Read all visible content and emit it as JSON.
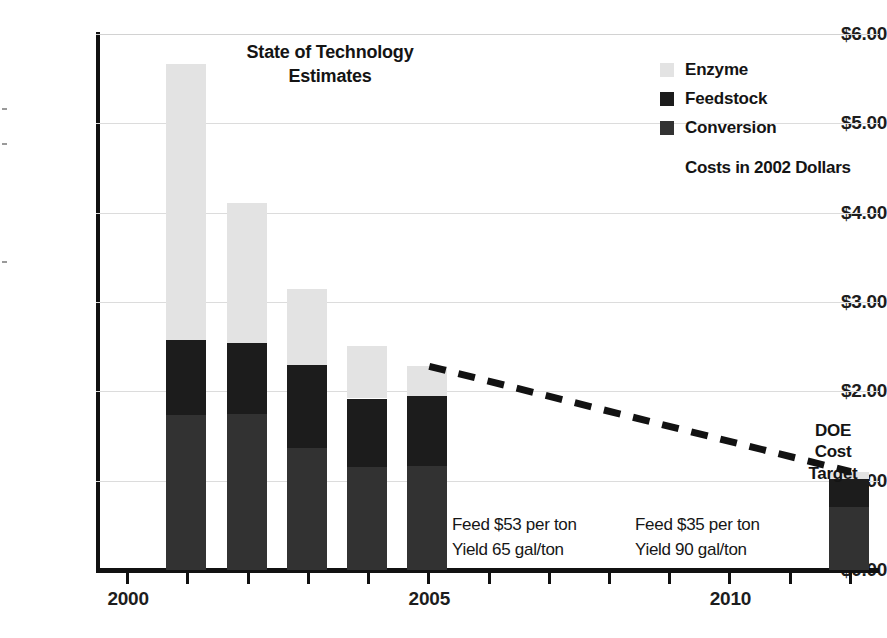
{
  "chart_data": {
    "type": "bar",
    "subtype": "stacked-bar-with-trendline",
    "title": "State of Technology Estimates",
    "xlabel": "",
    "ylabel": "",
    "ylim": [
      0,
      6
    ],
    "ytick_values": [
      0,
      1,
      2,
      3,
      4,
      5,
      6
    ],
    "ytick_labels": [
      "$0.00",
      "$1.00",
      "$2.00",
      "$3.00",
      "$4.00",
      "$5.00",
      "$6.00"
    ],
    "xlim": [
      1999.5,
      2012.5
    ],
    "xtick_values": [
      2000,
      2001,
      2002,
      2003,
      2004,
      2005,
      2006,
      2007,
      2008,
      2009,
      2010,
      2011,
      2012
    ],
    "xtick_labels": [
      "2000",
      "",
      "",
      "",
      "",
      "2005",
      "",
      "",
      "",
      "",
      "2010",
      "",
      ""
    ],
    "grid": true,
    "legend_position": "top-right",
    "categories": [
      "2001",
      "2002",
      "2003",
      "2004",
      "2005",
      "2012"
    ],
    "series": [
      {
        "name": "Conversion",
        "values": [
          1.74,
          1.75,
          1.37,
          1.15,
          1.16,
          0.7
        ]
      },
      {
        "name": "Feedstock",
        "values": [
          0.83,
          0.79,
          0.92,
          0.77,
          0.79,
          0.32
        ]
      },
      {
        "name": "Enzyme",
        "values": [
          3.1,
          1.57,
          0.86,
          0.59,
          0.33,
          0.08
        ]
      }
    ],
    "bar_totals": [
      5.67,
      4.11,
      3.15,
      2.51,
      2.28,
      1.1
    ],
    "trendline": {
      "style": "dashed",
      "from": {
        "x": 2005,
        "y": 2.28
      },
      "to": {
        "x": 2012,
        "y": 1.1
      }
    },
    "annotations": [
      {
        "name": "doe-cost-target",
        "text": [
          "DOE",
          "Cost",
          "Target"
        ]
      },
      {
        "name": "feed-note-left",
        "text": [
          "Feed $53 per ton",
          "Yield 65 gal/ton"
        ]
      },
      {
        "name": "feed-note-right",
        "text": [
          "Feed $35 per ton",
          "Yield 90 gal/ton"
        ]
      }
    ]
  },
  "title": {
    "line1": "State of Technology",
    "line2": "Estimates"
  },
  "legend": {
    "items": [
      {
        "label": "Enzyme",
        "color": "#e3e3e3"
      },
      {
        "label": "Feedstock",
        "color": "#1c1c1c"
      },
      {
        "label": "Conversion",
        "color": "#323232"
      }
    ],
    "note": "Costs in 2002 Dollars"
  },
  "axis": {
    "y_labels": [
      "$6.00",
      "$5.00",
      "$4.00",
      "$3.00",
      "$2.00",
      "$1.00",
      "$0.00"
    ],
    "x_labels": [
      {
        "value": "2000",
        "year": 2000
      },
      {
        "value": "2005",
        "year": 2005
      },
      {
        "value": "2010",
        "year": 2010
      }
    ]
  },
  "annotations": {
    "doe": {
      "l1": "DOE",
      "l2": "Cost",
      "l3": "Target"
    },
    "feed_left": {
      "l1": "Feed $53 per ton",
      "l2": "Yield 65 gal/ton"
    },
    "feed_right": {
      "l1": "Feed $35 per ton",
      "l2": "Yield 90 gal/ton"
    }
  },
  "colors": {
    "enzyme": "#e3e3e3",
    "feedstock": "#1c1c1c",
    "conversion": "#323232",
    "axis": "#111111",
    "grid": "#dcdcdc",
    "text": "#1a1a1a"
  }
}
